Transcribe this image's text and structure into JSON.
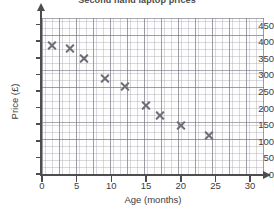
{
  "chart_data": {
    "type": "scatter",
    "title": "Second hand laptop prices",
    "xlabel": "Age (months)",
    "ylabel": "Price (£)",
    "xlim": [
      0,
      32
    ],
    "ylim": [
      0,
      470
    ],
    "x_ticks": [
      0,
      5,
      10,
      15,
      20,
      25,
      30
    ],
    "y_ticks": [
      0,
      50,
      100,
      150,
      200,
      250,
      300,
      350,
      400,
      450
    ],
    "grid": true,
    "minor_grid": true,
    "legend": null,
    "marker": "x",
    "marker_color": "#6e6e76",
    "points": [
      {
        "x": 1.5,
        "y": 388
      },
      {
        "x": 4,
        "y": 377
      },
      {
        "x": 6,
        "y": 347
      },
      {
        "x": 9,
        "y": 288
      },
      {
        "x": 12,
        "y": 265
      },
      {
        "x": 15,
        "y": 207
      },
      {
        "x": 17,
        "y": 176
      },
      {
        "x": 20,
        "y": 146
      },
      {
        "x": 24,
        "y": 116
      }
    ],
    "x": [
      1.5,
      4,
      6,
      9,
      12,
      15,
      17,
      20,
      24
    ],
    "values": [
      388,
      377,
      347,
      288,
      265,
      207,
      176,
      146,
      116
    ]
  },
  "colors": {
    "marker": "#6e6e76",
    "axis": "#4d4d4d",
    "grid_minor": "#9696a0",
    "grid_major": "#787884",
    "text": "#3c3c3c",
    "background": "#ffffff"
  }
}
